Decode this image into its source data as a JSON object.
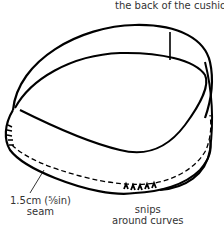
{
  "diagram": {
    "labels": {
      "top": "the back of the cushion",
      "seam_line1": "1.5cm (⅝in)",
      "seam_line2": "seam",
      "snips_line1": "snips",
      "snips_line2": "around curves"
    },
    "colors": {
      "stroke": "#000000",
      "text": "#333333",
      "background": "#ffffff"
    }
  }
}
